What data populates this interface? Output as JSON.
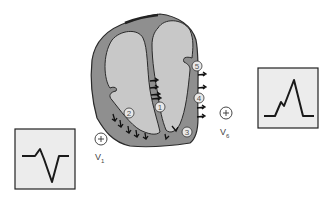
{
  "diagram": {
    "type": "cardiac-depolarization-sequence",
    "colors": {
      "heart_wall": "#8f8f8f",
      "chamber": "#c8c8c8",
      "outline": "#2a2a2a",
      "ecg_box_fill": "#ececec",
      "ecg_line": "#1a1a1a"
    },
    "steps": [
      {
        "label": "1",
        "location": "interventricular septum"
      },
      {
        "label": "2",
        "location": "right ventricle free wall"
      },
      {
        "label": "3",
        "location": "apex"
      },
      {
        "label": "4",
        "location": "left ventricle lateral wall"
      },
      {
        "label": "5",
        "location": "left ventricle base"
      }
    ],
    "leads": [
      {
        "name": "V1",
        "symbol": "+",
        "main": "V",
        "sub": "1",
        "ecg": "rS complex (small R, deep S)"
      },
      {
        "name": "V6",
        "symbol": "+",
        "main": "V",
        "sub": "6",
        "ecg": "qR complex (notched tall R)"
      }
    ]
  }
}
